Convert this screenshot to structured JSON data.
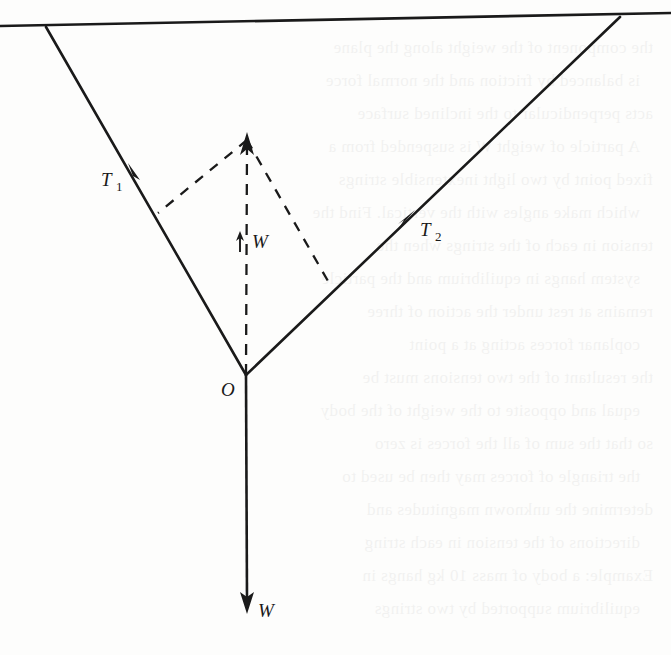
{
  "figure": {
    "type": "free-body-force-diagram",
    "caption": "",
    "background_color": "#fdfdfc",
    "ink_color": "#1a1a1a"
  },
  "labels": {
    "tension_left": "T",
    "tension_left_sub": "1",
    "tension_right": "T",
    "tension_right_sub": "2",
    "weight_resultant": "W",
    "weight_vector": "W",
    "origin": "O"
  },
  "geometry": {
    "ceiling_line": {
      "x1": 0,
      "y1": 26,
      "x2": 671,
      "y2": 13
    },
    "left_anchor": {
      "x": 46,
      "y": 27
    },
    "right_anchor": {
      "x": 620,
      "y": 17
    },
    "vertex": {
      "x": 246,
      "y": 375
    },
    "weight_arrow_tip": {
      "x": 247,
      "y": 612
    },
    "resultant_arrow_tip": {
      "x": 247,
      "y": 133
    },
    "parallelogram_left_corner": {
      "x": 158,
      "y": 213
    },
    "parallelogram_right_corner": {
      "x": 332,
      "y": 288
    },
    "t1_arrowhead": {
      "x": 131,
      "y": 168
    },
    "t2_arrowhead": {
      "x": 412,
      "y": 214
    },
    "w_tick_marker": {
      "x": 240,
      "y": 241
    }
  },
  "label_positions": {
    "t1": {
      "x": 101,
      "y": 186
    },
    "t2": {
      "x": 420,
      "y": 236
    },
    "w_resultant": {
      "x": 252,
      "y": 247
    },
    "w_weight": {
      "x": 258,
      "y": 616
    },
    "origin": {
      "x": 222,
      "y": 395
    }
  },
  "bleed_text": {
    "lines": [
      "the component of the weight along the plane",
      "is balanced by friction and the normal force",
      "acts perpendicular to the inclined surface",
      "A particle of weight W is suspended from a",
      "fixed point by two light inextensible strings",
      "which make angles with the vertical. Find the",
      "tension in each of the strings when the",
      "system hangs in equilibrium and the particle",
      "remains at rest under the action of three",
      "coplanar forces acting at a point",
      "the resultant of the two tensions must be",
      "equal and opposite to the weight of the body",
      "so that the sum of all the forces is zero",
      "the triangle of forces may then be used to",
      "determine the unknown magnitudes and",
      "directions of the tension in each string",
      "Example: a body of mass 10 kg hangs in",
      "equilibrium supported by two strings"
    ]
  }
}
